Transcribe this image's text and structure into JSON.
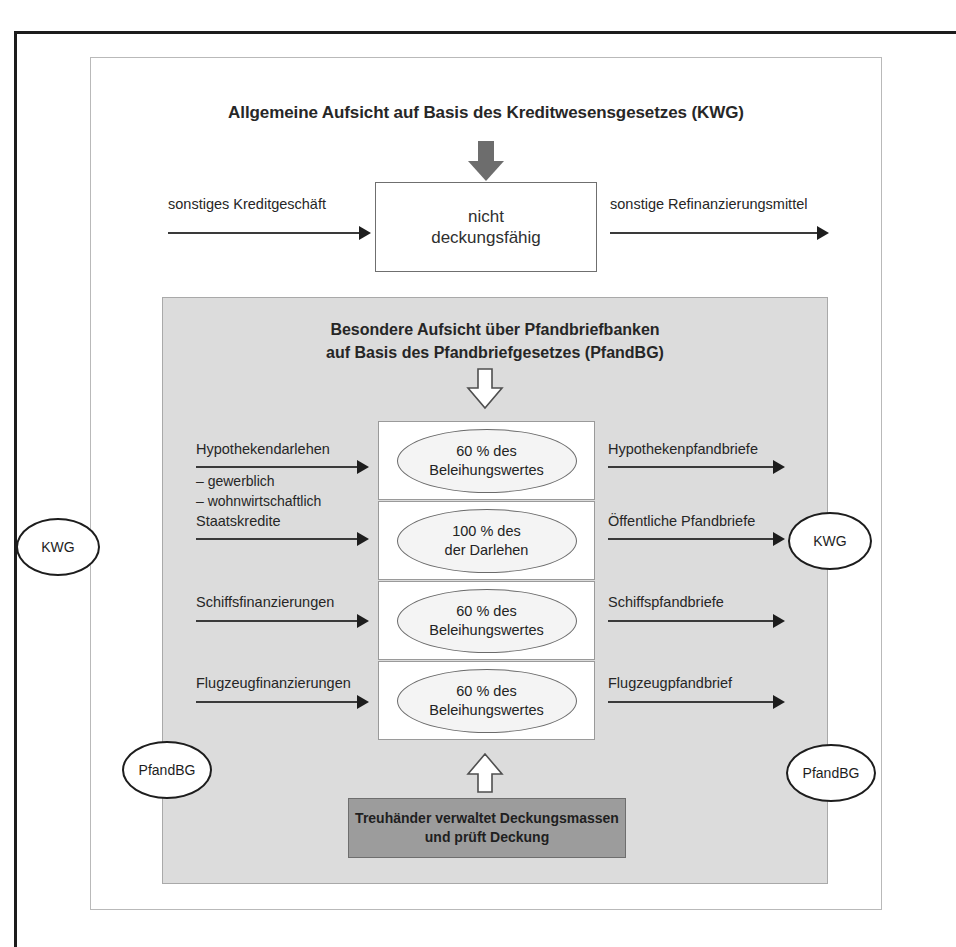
{
  "page": {
    "kwg_section_title": "Allgemeine Aufsicht auf Basis des Kreditwesensgesetzes (KWG)",
    "non_eligible_box": "nicht\ndeckungsfähig",
    "top_left_arrow_label": "sonstiges Kreditgeschäft",
    "top_right_arrow_label": "sonstige Refinanzierungsmittel",
    "pfandbg_title_line1": "Besondere Aufsicht über Pfandbriefbanken",
    "pfandbg_title_line2": "auf Basis des Pfandbriefgesetzes (PfandBG)",
    "trustee_box": "Treuhänder verwaltet Deckungsmassen\nund prüft Deckung"
  },
  "rows": [
    {
      "left_label": "Hypothekendarlehen",
      "left_sublist": "– gewerblich\n– wohnwirtschaftlich",
      "center_line1": "60 % des",
      "center_line2": "Beleihungswertes",
      "right_label": "Hypothekenpfandbriefe"
    },
    {
      "left_label": "Staatskredite",
      "left_sublist": "",
      "center_line1": "100 % des",
      "center_line2": "der Darlehen",
      "right_label": "Öffentliche Pfandbriefe"
    },
    {
      "left_label": "Schiffsfinanzierungen",
      "left_sublist": "",
      "center_line1": "60 % des",
      "center_line2": "Beleihungswertes",
      "right_label": "Schiffspfandbriefe"
    },
    {
      "left_label": "Flugzeugfinanzierungen",
      "left_sublist": "",
      "center_line1": "60 % des",
      "center_line2": "Beleihungswertes",
      "right_label": "Flugzeugpfandbrief"
    }
  ],
  "badges": {
    "kwg_left": "KWG",
    "kwg_right": "KWG",
    "pfandbg_left": "PfandBG",
    "pfandbg_right": "PfandBG"
  },
  "colors": {
    "panel_gray": "#dcdcdc",
    "trustee_gray": "#9c9c9c",
    "arrow_dark": "#6d6d6d",
    "ink": "#262626",
    "frame": "#b9b9b9"
  }
}
